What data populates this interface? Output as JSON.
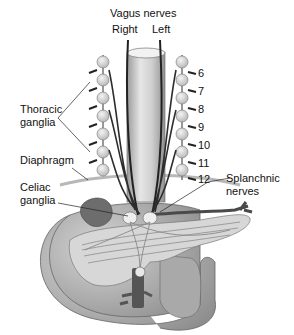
{
  "diagram": {
    "title": "Vagus nerves",
    "labels": {
      "vagus_title": "Vagus nerves",
      "right": "Right",
      "left": "Left",
      "thoracic_line1": "Thoracic",
      "thoracic_line2": "ganglia",
      "diaphragm": "Diaphragm",
      "celiac_line1": "Celiac",
      "celiac_line2": "ganglia",
      "splanchnic_line1": "Splanchnic",
      "splanchnic_line2": "nerves"
    },
    "vertebral_levels": [
      "6",
      "7",
      "8",
      "9",
      "10",
      "11",
      "12"
    ],
    "colors": {
      "background": "#ffffff",
      "text": "#111111",
      "nerve": "#333333",
      "ganglion": "#d9d9d9",
      "organ": "#bdbdbd",
      "organ_dark": "#8a8a8a",
      "vessel": "#555555"
    }
  }
}
